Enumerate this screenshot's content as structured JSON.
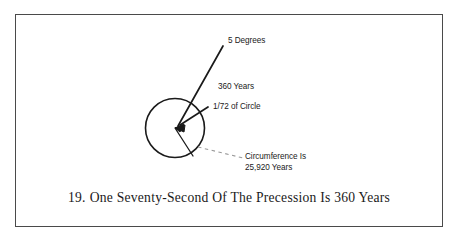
{
  "figure": {
    "border_color": "#4a4a4a",
    "background": "#ffffff",
    "stroke_color": "#1a1a1a",
    "dash_color": "#9a9a9a"
  },
  "diagram": {
    "circle": {
      "name": "precession-circle",
      "center_x": 175,
      "center_y": 128,
      "radius": 29.5
    },
    "labels": {
      "degrees": "5 Degrees",
      "years": "360 Years",
      "fraction": "1/72 of Circle",
      "circumference_line1": "Circumference Is",
      "circumference_line2": "25,920 Years"
    }
  },
  "caption": {
    "number": "19.",
    "text": "One Seventy-Second Of The Precession Is 360 Years"
  }
}
